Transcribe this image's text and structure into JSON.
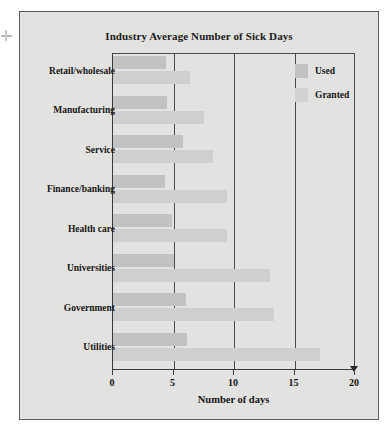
{
  "figure": {
    "title": "Industry Average Number of Sick Days",
    "xlabel": "Number of days",
    "background_color": "#e2e2e0",
    "frame_color": "#5d5d5d"
  },
  "legend": {
    "position": "top-right-inside",
    "items": [
      {
        "label": "Used",
        "color": "#c2c2c2"
      },
      {
        "label": "Granted",
        "color": "#d2d2d2"
      }
    ]
  },
  "axis": {
    "ticks": [
      "0",
      "5",
      "10",
      "15",
      "20"
    ],
    "tick_values": [
      0,
      5,
      10,
      15,
      20
    ]
  },
  "chart_data": {
    "type": "bar",
    "orientation": "horizontal",
    "title": "Industry Average Number of Sick Days",
    "xlabel": "Number of days",
    "ylabel": "",
    "xlim": [
      0,
      20
    ],
    "xticks": [
      0,
      5,
      10,
      15,
      20
    ],
    "grid": true,
    "legend_position": "top right inside plot",
    "categories": [
      "Retail/wholesale",
      "Manufacturing",
      "Service",
      "Finance/banking",
      "Health care",
      "Universities",
      "Government",
      "Utilities"
    ],
    "series": [
      {
        "name": "Used",
        "color": "#c2c2c2",
        "values": [
          4.4,
          4.5,
          5.8,
          4.3,
          4.9,
          5.0,
          6.0,
          6.1
        ]
      },
      {
        "name": "Granted",
        "color": "#cfcfcf",
        "values": [
          6.4,
          7.5,
          8.3,
          9.4,
          9.4,
          13.0,
          13.3,
          17.1
        ]
      }
    ]
  }
}
